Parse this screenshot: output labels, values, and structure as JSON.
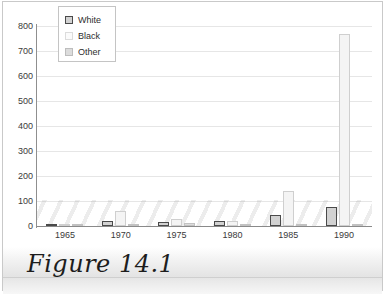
{
  "figure": {
    "caption": "Figure 14.1"
  },
  "legend": {
    "position": "top-left",
    "entries": [
      {
        "label": "White",
        "swatch": "series-white-swatch",
        "color": "#d2d2d2",
        "border": "#4a4a4a"
      },
      {
        "label": "Black",
        "swatch": "series-black-swatch",
        "color": "#fbfbfb",
        "border": "#dcdcdc"
      },
      {
        "label": "Other",
        "swatch": "series-other-swatch",
        "color": "#dcdcdc",
        "border": "#bdbdbd"
      }
    ]
  },
  "axes": {
    "y_ticks": [
      "800",
      "700",
      "600",
      "500",
      "400",
      "300",
      "200",
      "100",
      "0"
    ],
    "x_ticks": [
      "1965",
      "1970",
      "1975",
      "1980",
      "1985",
      "1990"
    ]
  },
  "chart_data": {
    "type": "bar",
    "title": "",
    "xlabel": "",
    "ylabel": "",
    "ylim": [
      0,
      800
    ],
    "ytick_step": 100,
    "grid": true,
    "legend_position": "top-left",
    "categories": [
      "1965",
      "1970",
      "1975",
      "1980",
      "1985",
      "1990"
    ],
    "series": [
      {
        "name": "White",
        "values": [
          5,
          20,
          18,
          20,
          45,
          78
        ]
      },
      {
        "name": "Black",
        "values": [
          8,
          62,
          30,
          22,
          140,
          770
        ]
      },
      {
        "name": "Other",
        "values": [
          6,
          8,
          12,
          6,
          8,
          8
        ]
      }
    ]
  }
}
